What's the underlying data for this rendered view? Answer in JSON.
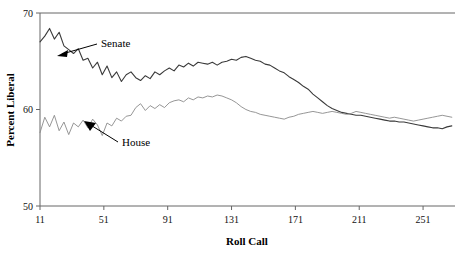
{
  "chart_data": {
    "type": "line",
    "title": "",
    "xlabel": "Roll Call",
    "ylabel": "Percent Liberal",
    "xlim": [
      11,
      271
    ],
    "ylim": [
      50,
      70
    ],
    "xticks": [
      11,
      51,
      91,
      131,
      171,
      211,
      251
    ],
    "yticks": [
      50,
      60,
      70
    ],
    "grid": false,
    "legend_position": "inline-annotations",
    "annotations": [
      {
        "text": "Senate",
        "target_x": 30,
        "target_y": 65.2
      },
      {
        "text": "House",
        "target_x": 42,
        "target_y": 59.3
      }
    ],
    "series": [
      {
        "name": "Senate",
        "color": "#3a3a3a",
        "x": [
          11,
          14,
          17,
          20,
          23,
          26,
          29,
          32,
          35,
          38,
          41,
          44,
          47,
          50,
          53,
          56,
          59,
          62,
          65,
          68,
          71,
          74,
          77,
          80,
          83,
          86,
          89,
          92,
          95,
          98,
          101,
          104,
          107,
          110,
          113,
          116,
          119,
          122,
          125,
          128,
          131,
          134,
          137,
          140,
          143,
          146,
          149,
          152,
          155,
          158,
          161,
          164,
          167,
          170,
          173,
          176,
          179,
          182,
          185,
          188,
          191,
          194,
          197,
          200,
          203,
          206,
          209,
          212,
          215,
          218,
          221,
          224,
          227,
          230,
          233,
          236,
          239,
          242,
          245,
          248,
          251,
          254,
          257,
          260,
          263,
          266,
          269
        ],
        "values": [
          67.0,
          67.6,
          68.4,
          67.3,
          68.0,
          66.6,
          66.2,
          65.8,
          66.3,
          65.1,
          65.3,
          64.3,
          64.9,
          63.6,
          64.5,
          63.3,
          63.9,
          62.9,
          63.6,
          63.9,
          63.3,
          63.0,
          63.5,
          63.2,
          63.9,
          63.6,
          64.0,
          64.3,
          64.0,
          64.6,
          64.4,
          64.8,
          64.5,
          64.9,
          64.8,
          64.7,
          64.9,
          64.6,
          64.9,
          65.0,
          65.2,
          65.1,
          65.4,
          65.5,
          65.3,
          65.1,
          65.0,
          64.7,
          64.6,
          64.3,
          64.0,
          63.8,
          63.4,
          63.1,
          62.8,
          62.4,
          62.1,
          61.6,
          61.2,
          60.8,
          60.4,
          60.1,
          59.9,
          59.7,
          59.6,
          59.5,
          59.4,
          59.4,
          59.3,
          59.2,
          59.1,
          59.0,
          58.9,
          58.8,
          58.8,
          58.7,
          58.7,
          58.6,
          58.5,
          58.4,
          58.3,
          58.2,
          58.1,
          58.1,
          58.0,
          58.2,
          58.3
        ]
      },
      {
        "name": "House",
        "color": "#8a8a8a",
        "x": [
          11,
          14,
          17,
          20,
          23,
          26,
          29,
          32,
          35,
          38,
          41,
          44,
          47,
          50,
          53,
          56,
          59,
          62,
          65,
          68,
          71,
          74,
          77,
          80,
          83,
          86,
          89,
          92,
          95,
          98,
          101,
          104,
          107,
          110,
          113,
          116,
          119,
          122,
          125,
          128,
          131,
          134,
          137,
          140,
          143,
          146,
          149,
          152,
          155,
          158,
          161,
          164,
          167,
          170,
          173,
          176,
          179,
          182,
          185,
          188,
          191,
          194,
          197,
          200,
          203,
          206,
          209,
          212,
          215,
          218,
          221,
          224,
          227,
          230,
          233,
          236,
          239,
          242,
          245,
          248,
          251,
          254,
          257,
          260,
          263,
          266,
          269
        ],
        "values": [
          57.6,
          59.2,
          58.2,
          59.4,
          57.8,
          58.7,
          57.4,
          58.6,
          58.2,
          58.9,
          58.1,
          59.0,
          58.4,
          57.3,
          58.6,
          58.3,
          59.1,
          58.8,
          59.3,
          59.4,
          60.2,
          60.6,
          59.9,
          60.4,
          60.1,
          60.5,
          60.2,
          60.7,
          60.9,
          61.0,
          60.8,
          61.2,
          61.0,
          61.3,
          61.2,
          61.4,
          61.3,
          61.5,
          61.4,
          61.2,
          61.0,
          60.7,
          60.3,
          60.0,
          59.8,
          59.7,
          59.5,
          59.4,
          59.3,
          59.2,
          59.1,
          59.0,
          59.2,
          59.3,
          59.5,
          59.6,
          59.7,
          59.8,
          59.7,
          59.6,
          59.7,
          59.8,
          59.7,
          59.6,
          59.5,
          59.6,
          59.8,
          59.7,
          59.6,
          59.5,
          59.4,
          59.3,
          59.2,
          59.1,
          59.2,
          59.1,
          59.0,
          58.9,
          58.8,
          58.9,
          59.0,
          59.1,
          59.2,
          59.3,
          59.4,
          59.3,
          59.2
        ]
      }
    ]
  },
  "axes": {
    "ylabel": "Percent Liberal",
    "xlabel": "Roll Call",
    "ytick_labels": [
      "70",
      "60",
      "50"
    ],
    "xtick_labels": [
      "11",
      "51",
      "91",
      "131",
      "171",
      "211",
      "251"
    ]
  },
  "labels": {
    "senate": "Senate",
    "house": "House"
  }
}
